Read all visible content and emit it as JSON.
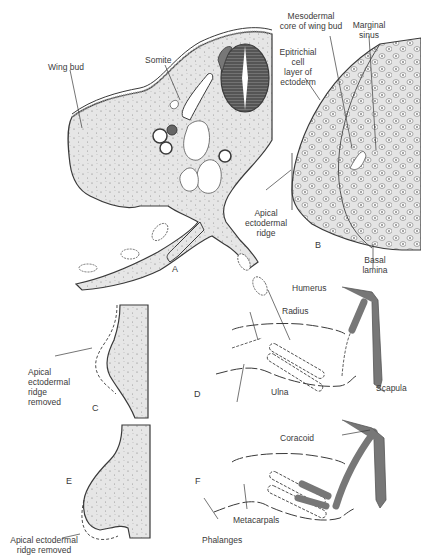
{
  "figure": {
    "panels": {
      "A": "A",
      "B": "B",
      "C": "C",
      "D": "D",
      "E": "E",
      "F": "F"
    },
    "labels": {
      "wing_bud": "Wing bud",
      "somite": "Somite",
      "mesodermal_core_l1": "Mesodermal",
      "mesodermal_core_l2": "core of wing bud",
      "marginal_sinus_l1": "Marginal",
      "marginal_sinus_l2": "sinus",
      "epitrichial_l1": "Epitrichial",
      "epitrichial_l2": "cell",
      "epitrichial_l3": "layer of",
      "epitrichial_l4": "ectoderm",
      "aer_l1": "Apical",
      "aer_l2": "ectodermal",
      "aer_l3": "ridge",
      "basal_lamina_l1": "Basal",
      "basal_lamina_l2": "lamina",
      "humerus": "Humerus",
      "radius": "Radius",
      "ulna": "Ulna",
      "scapula": "Scapula",
      "aer_removed_c_l1": "Apical",
      "aer_removed_c_l2": "ectodermal",
      "aer_removed_c_l3": "ridge",
      "aer_removed_c_l4": "removed",
      "aer_removed_e_l1": "Apical ectodermal",
      "aer_removed_e_l2": "ridge removed",
      "coracoid": "Coracoid",
      "metacarpals": "Metacarpals",
      "phalanges": "Phalanges"
    },
    "colors": {
      "tissue_fill": "#e6e6e6",
      "bone_fill": "#7a7a7a",
      "outline": "#3a3a3a",
      "text": "#3a3a3a"
    }
  }
}
